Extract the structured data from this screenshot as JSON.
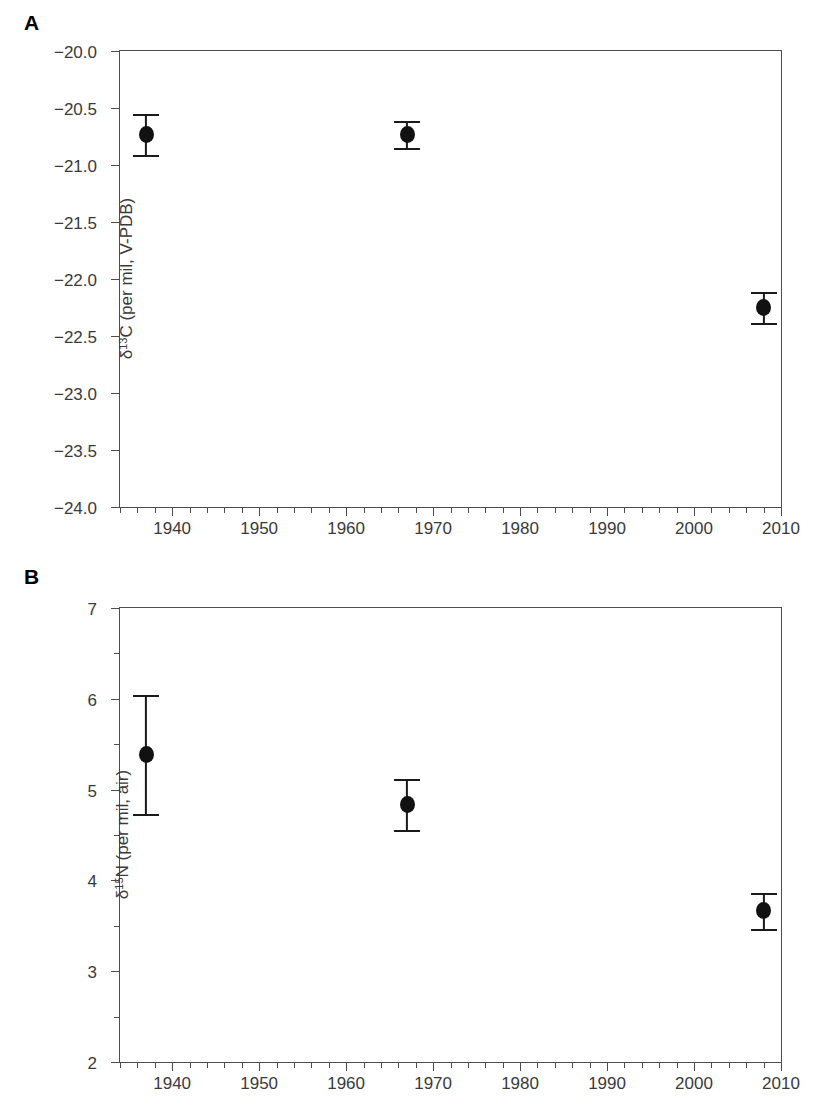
{
  "figure": {
    "panels": [
      {
        "letter": "A",
        "name": "panel-a"
      },
      {
        "letter": "B",
        "name": "panel-b"
      }
    ]
  },
  "chart_data": [
    {
      "type": "scatter",
      "panel": "A",
      "title": "",
      "xlabel": "",
      "ylabel": "δ13C (per mil, V-PDB)",
      "ylabel_parts": {
        "delta": "δ",
        "superscript": "13",
        "rest": "C (per mil, V-PDB)"
      },
      "xlim": [
        1934,
        2010
      ],
      "ylim": [
        -24.0,
        -20.0
      ],
      "grid": false,
      "legend": "none",
      "xticks": [
        1940,
        1950,
        1960,
        1970,
        1980,
        1990,
        2000,
        2010
      ],
      "xtick_labels": [
        "1940",
        "1950",
        "1960",
        "1970",
        "1980",
        "1990",
        "2000",
        "2010"
      ],
      "xminor_step": 2,
      "yticks": [
        -20.0,
        -20.5,
        -21.0,
        -21.5,
        -22.0,
        -22.5,
        -23.0,
        -23.5,
        -24.0
      ],
      "ytick_labels": [
        "−20.0",
        "−20.5",
        "−21.0",
        "−21.5",
        "−22.0",
        "−22.5",
        "−23.0",
        "−23.5",
        "−24.0"
      ],
      "points": [
        {
          "x": 1937,
          "y": -20.73,
          "err": 0.18,
          "y_low": -20.91,
          "y_high": -20.55
        },
        {
          "x": 1967,
          "y": -20.73,
          "err": 0.12,
          "y_low": -20.85,
          "y_high": -20.61
        },
        {
          "x": 2008,
          "y": -22.25,
          "err": 0.14,
          "y_low": -22.39,
          "y_high": -22.11
        }
      ]
    },
    {
      "type": "scatter",
      "panel": "B",
      "title": "",
      "xlabel": "",
      "ylabel": "δ15N (per mil, air)",
      "ylabel_parts": {
        "delta": "δ",
        "superscript": "15",
        "rest": "N (per mil, air)"
      },
      "xlim": [
        1934,
        2010
      ],
      "ylim": [
        2,
        7
      ],
      "grid": false,
      "legend": "none",
      "xticks": [
        1940,
        1950,
        1960,
        1970,
        1980,
        1990,
        2000,
        2010
      ],
      "xtick_labels": [
        "1940",
        "1950",
        "1960",
        "1970",
        "1980",
        "1990",
        "2000",
        "2010"
      ],
      "xminor_step": 2,
      "yticks": [
        7,
        6,
        5,
        4,
        3,
        2
      ],
      "ytick_labels": [
        "7",
        "6",
        "5",
        "4",
        "3",
        "2"
      ],
      "points": [
        {
          "x": 1937,
          "y": 5.39,
          "err": 0.66,
          "y_low": 4.73,
          "y_high": 6.04
        },
        {
          "x": 1967,
          "y": 4.84,
          "err": 0.29,
          "y_low": 4.55,
          "y_high": 5.12
        },
        {
          "x": 2008,
          "y": 3.67,
          "err": 0.2,
          "y_low": 3.47,
          "y_high": 3.86
        }
      ]
    }
  ],
  "colors": {
    "marker": "#111111",
    "axis": "#4d4d4d",
    "text": "#3a3a3a",
    "background": "#ffffff"
  }
}
